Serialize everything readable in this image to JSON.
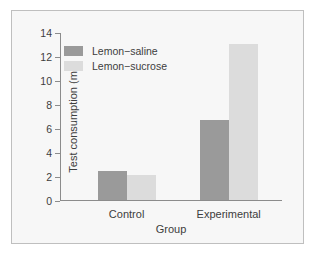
{
  "chart_data": {
    "type": "bar",
    "title": "",
    "xlabel": "Group",
    "ylabel": "Test consumption (mL)",
    "categories": [
      "Control",
      "Experimental"
    ],
    "series": [
      {
        "name": "Lemon−saline",
        "color": "#9a9a9a",
        "values": [
          2.4,
          6.7
        ]
      },
      {
        "name": "Lemon−sucrose",
        "color": "#dcdcdc",
        "values": [
          2.1,
          13.0
        ]
      }
    ],
    "ylim": [
      0,
      14
    ],
    "ytick_labels": [
      "0",
      "2",
      "4",
      "6",
      "8",
      "10",
      "12",
      "14"
    ],
    "ytick_values": [
      0,
      2,
      4,
      6,
      8,
      10,
      12,
      14
    ],
    "grid": false,
    "legend_position": "upper-left-inside"
  },
  "figure": {
    "background_color": "#f7f7f7",
    "border_color": "#bfbfbf",
    "axis_color": "#8c8c8c",
    "text_color": "#3d3d3d"
  }
}
